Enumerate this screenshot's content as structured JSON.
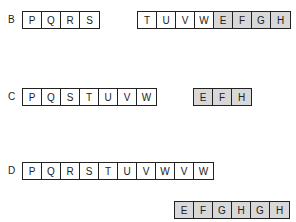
{
  "rows": [
    {
      "label": "B",
      "groups": [
        {
          "cells": [
            {
              "t": "P",
              "s": false
            },
            {
              "t": "Q",
              "s": false
            },
            {
              "t": "R",
              "s": false
            },
            {
              "t": "S",
              "s": false
            }
          ]
        },
        {
          "cells": [
            {
              "t": "T",
              "s": false
            },
            {
              "t": "U",
              "s": false
            },
            {
              "t": "V",
              "s": false
            },
            {
              "t": "W",
              "s": false
            },
            {
              "t": "E",
              "s": true
            },
            {
              "t": "F",
              "s": true
            },
            {
              "t": "G",
              "s": true
            },
            {
              "t": "H",
              "s": true
            }
          ]
        }
      ]
    },
    {
      "label": "C",
      "groups": [
        {
          "cells": [
            {
              "t": "P",
              "s": false
            },
            {
              "t": "Q",
              "s": false
            },
            {
              "t": "S",
              "s": false
            },
            {
              "t": "T",
              "s": false
            },
            {
              "t": "U",
              "s": false
            },
            {
              "t": "V",
              "s": false
            },
            {
              "t": "W",
              "s": false
            }
          ]
        },
        {
          "cells": [
            {
              "t": "E",
              "s": true
            },
            {
              "t": "F",
              "s": true
            },
            {
              "t": "H",
              "s": true
            }
          ]
        }
      ]
    },
    {
      "label": "D",
      "groups": [
        {
          "cells": [
            {
              "t": "P",
              "s": false
            },
            {
              "t": "Q",
              "s": false
            },
            {
              "t": "R",
              "s": false
            },
            {
              "t": "S",
              "s": false
            },
            {
              "t": "T",
              "s": false
            },
            {
              "t": "U",
              "s": false
            },
            {
              "t": "V",
              "s": false
            },
            {
              "t": "W",
              "s": false
            },
            {
              "t": "V",
              "s": false
            },
            {
              "t": "W",
              "s": false
            }
          ]
        },
        {
          "cells": [
            {
              "t": "E",
              "s": true
            },
            {
              "t": "F",
              "s": true
            },
            {
              "t": "G",
              "s": true
            },
            {
              "t": "H",
              "s": true
            },
            {
              "t": "G",
              "s": true
            },
            {
              "t": "H",
              "s": true
            }
          ]
        }
      ]
    }
  ]
}
